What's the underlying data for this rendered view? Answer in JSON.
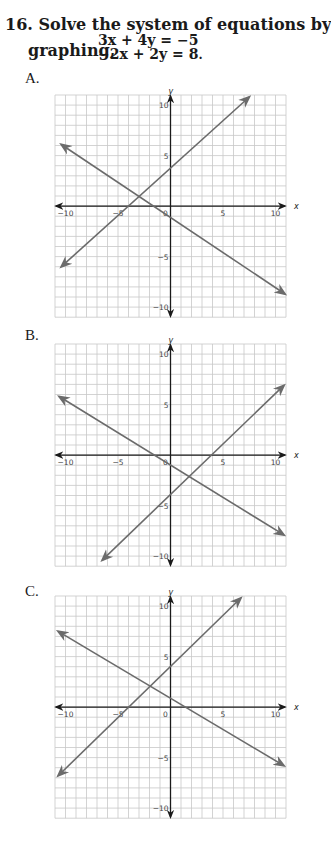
{
  "question": {
    "number": "16.",
    "line1": "Solve the system of equations by",
    "lead": "graphing,",
    "equations": [
      "3x + 4y = −5",
      "−2x + 2y = 8"
    ],
    "trail": "."
  },
  "choices": [
    {
      "label": "A.",
      "top": 70,
      "graph_top": 88
    },
    {
      "label": "B.",
      "top": 327,
      "graph_top": 337
    },
    {
      "label": "C.",
      "top": 583,
      "graph_top": 589
    }
  ],
  "axis": {
    "x_label": "x",
    "y_label": "y",
    "x_ticks": [
      "−10",
      "−5",
      "0",
      "5",
      "10"
    ],
    "y_ticks": [
      "10",
      "5",
      "−5",
      "−10"
    ]
  },
  "colors": {
    "grid": "#c8c8c8",
    "axis": "#1a1a1a",
    "line": "#6b6b6b",
    "text": "#1a1a1a"
  },
  "chart_data": [
    {
      "type": "line",
      "title": "A.",
      "xlabel": "x",
      "ylabel": "y",
      "xlim": [
        -11,
        11
      ],
      "ylim": [
        -11,
        11
      ],
      "grid": true,
      "x_ticks": [
        -10,
        -5,
        0,
        5,
        10
      ],
      "y_ticks": [
        -10,
        -5,
        5,
        10
      ],
      "series": [
        {
          "name": "rising line",
          "x": [
            -10.4,
            7.5
          ],
          "y": [
            -6.0,
            10.8
          ]
        },
        {
          "name": "falling line",
          "x": [
            -10.4,
            10.9
          ],
          "y": [
            6.1,
            -8.7
          ]
        }
      ],
      "intersection": [
        -3,
        1
      ]
    },
    {
      "type": "line",
      "title": "B.",
      "xlabel": "x",
      "ylabel": "y",
      "xlim": [
        -11,
        11
      ],
      "ylim": [
        -11,
        11
      ],
      "grid": true,
      "x_ticks": [
        -10,
        -5,
        0,
        5,
        10
      ],
      "y_ticks": [
        -10,
        -5,
        5,
        10
      ],
      "series": [
        {
          "name": "rising line",
          "x": [
            -6.5,
            10.8
          ],
          "y": [
            -10.4,
            6.9
          ]
        },
        {
          "name": "falling line",
          "x": [
            -10.6,
            10.8
          ],
          "y": [
            5.8,
            -7.9
          ]
        }
      ],
      "intersection": [
        1.8,
        -2.3
      ]
    },
    {
      "type": "line",
      "title": "C.",
      "xlabel": "x",
      "ylabel": "y",
      "xlim": [
        -11,
        11
      ],
      "ylim": [
        -11,
        11
      ],
      "grid": true,
      "x_ticks": [
        -10,
        -5,
        0,
        5,
        10
      ],
      "y_ticks": [
        -10,
        -5,
        5,
        10
      ],
      "series": [
        {
          "name": "rising line",
          "x": [
            -10.7,
            6.7
          ],
          "y": [
            -6.8,
            10.8
          ]
        },
        {
          "name": "falling line",
          "x": [
            -10.7,
            10.8
          ],
          "y": [
            7.5,
            -5.8
          ]
        }
      ],
      "intersection": [
        -2,
        2
      ]
    }
  ]
}
